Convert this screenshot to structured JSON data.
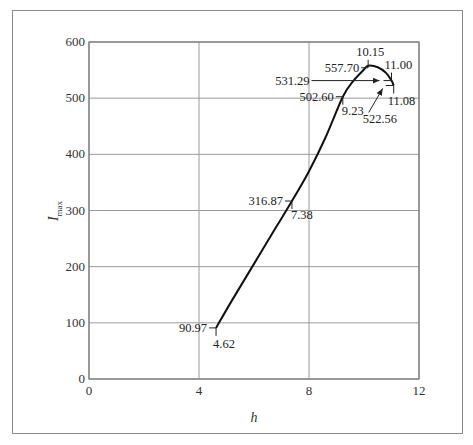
{
  "chart_data": {
    "type": "line",
    "title": "",
    "xlabel": "h",
    "ylabel": "I_max",
    "ylabel_main": "I",
    "ylabel_sub": "max",
    "xlim": [
      0,
      12
    ],
    "ylim": [
      0,
      600
    ],
    "grid": true,
    "legend": null,
    "x_ticks": [
      0,
      4,
      8,
      12
    ],
    "y_ticks": [
      0,
      100,
      200,
      300,
      400,
      500,
      600
    ],
    "x_tick_labels": [
      "0",
      "4",
      "8",
      "12"
    ],
    "y_tick_labels": [
      "0",
      "100",
      "200",
      "300",
      "400",
      "500",
      "600"
    ],
    "series": [
      {
        "name": "I_max vs h",
        "x": [
          4.62,
          5.2,
          6.0,
          6.8,
          7.38,
          8.0,
          8.6,
          9.23,
          9.6,
          10.0,
          10.15,
          10.5,
          10.8,
          11.0,
          11.08
        ],
        "y": [
          90.97,
          140,
          205,
          270,
          316.87,
          370,
          430,
          502.6,
          530,
          551,
          557.7,
          555,
          545,
          531.29,
          522.56
        ]
      }
    ],
    "annotations": [
      {
        "label_y": "90.97",
        "label_x": "4.62",
        "x": 4.62,
        "y": 90.97
      },
      {
        "label_y": "316.87",
        "label_x": "7.38",
        "x": 7.38,
        "y": 316.87
      },
      {
        "label_y": "502.60",
        "label_x": "9.23",
        "x": 9.23,
        "y": 502.6
      },
      {
        "label_y": "557.70",
        "label_x": "10.15",
        "x": 10.15,
        "y": 557.7
      },
      {
        "label_y": "531.29",
        "label_x": "11.00",
        "x": 11.0,
        "y": 531.29,
        "style": "arrow"
      },
      {
        "label_y": "522.56",
        "label_x": "11.08",
        "x": 11.08,
        "y": 522.56,
        "style": "arrow"
      }
    ]
  },
  "colors": {
    "curve": "#111111",
    "grid": "#9a9a9a",
    "axis": "#777777",
    "frame": "#8a8a8a"
  }
}
